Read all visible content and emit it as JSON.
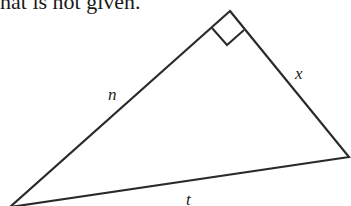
{
  "caption": {
    "text": "hat is not given."
  },
  "diagram": {
    "type": "right-triangle",
    "stroke_color": "#2a2a2a",
    "vertices": {
      "top": [
        230,
        11
      ],
      "right": [
        349,
        157
      ],
      "bottom_left": [
        10,
        207
      ]
    },
    "right_angle_at": "top",
    "labels": {
      "hypotenuse_left": "n",
      "right_leg": "x",
      "bottom_side": "t"
    }
  }
}
